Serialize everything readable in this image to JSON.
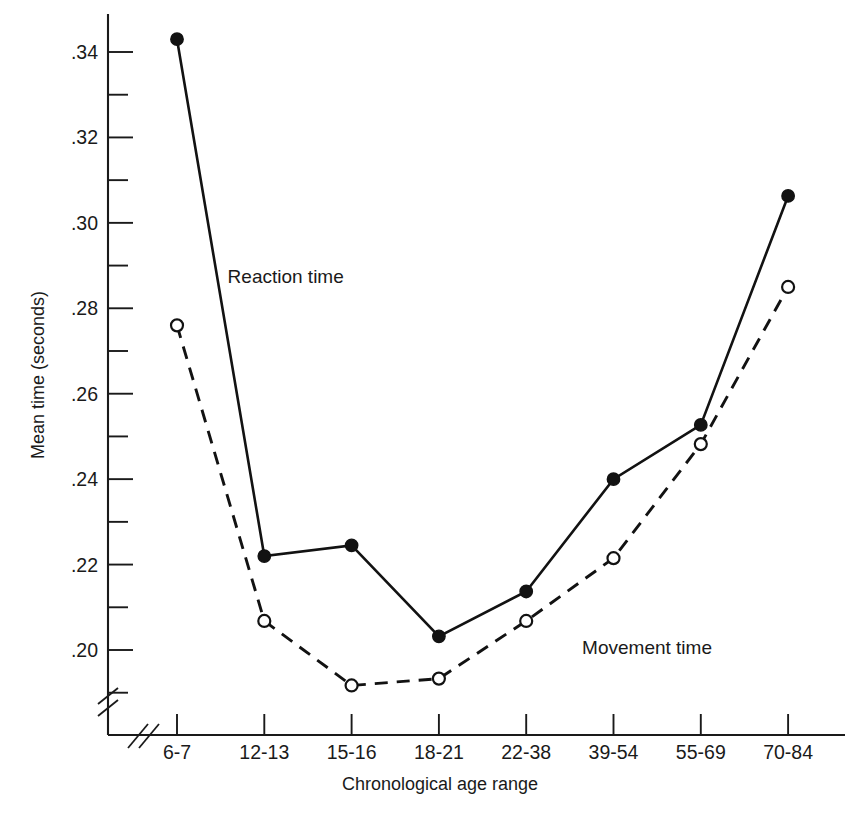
{
  "chart_data": {
    "type": "line",
    "title": "",
    "xlabel": "Chronological age range",
    "ylabel": "Mean time (seconds)",
    "categories": [
      "6-7",
      "12-13",
      "15-16",
      "18-21",
      "22-38",
      "39-54",
      "55-69",
      "70-84"
    ],
    "ylim": [
      0.19,
      0.35
    ],
    "ytick_labels": [
      ".34",
      ".32",
      ".30",
      ".28",
      ".26",
      ".24",
      ".22",
      ".20"
    ],
    "ytick_values": [
      0.34,
      0.32,
      0.3,
      0.28,
      0.26,
      0.24,
      0.22,
      0.2
    ],
    "yminor_values": [
      0.33,
      0.31,
      0.29,
      0.27,
      0.25,
      0.23,
      0.21,
      0.19
    ],
    "grid": false,
    "legend_position": "inline-annotation",
    "axis_break_x": true,
    "axis_break_y": true,
    "series": [
      {
        "name": "Reaction time",
        "marker": "filled-circle",
        "line_style": "solid",
        "color": "#121212",
        "values": [
          0.343,
          0.222,
          0.2245,
          0.2032,
          0.2137,
          0.24,
          0.2527,
          0.3063
        ],
        "label_x": 0.58,
        "label_y": 0.286
      },
      {
        "name": "Movement time",
        "marker": "open-circle",
        "line_style": "dashed",
        "color": "#121212",
        "values": [
          0.276,
          0.2068,
          0.1917,
          0.1933,
          0.2068,
          0.2215,
          0.2482,
          0.285
        ],
        "label_x": 4.64,
        "label_y": 0.199
      }
    ]
  },
  "figure": {
    "background_color": "#ffffff",
    "ink_color": "#121212"
  }
}
